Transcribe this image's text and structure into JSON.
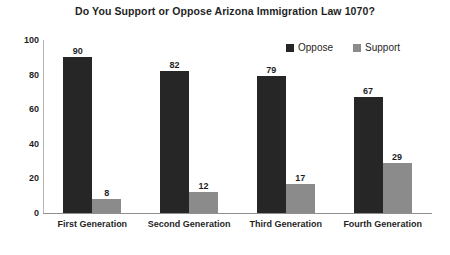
{
  "chart_data": {
    "type": "bar",
    "title": "Do You Support or Oppose Arizona Immigration Law 1070?",
    "xlabel": "",
    "ylabel": "",
    "ylim": [
      0,
      100
    ],
    "yticks": [
      100,
      80,
      60,
      40,
      20,
      0
    ],
    "grid": false,
    "legend_position": "top-right",
    "categories": [
      "First Generation",
      "Second Generation",
      "Third Generation",
      "Fourth Generation"
    ],
    "series": [
      {
        "name": "Oppose",
        "color": "#262626",
        "values": [
          90,
          82,
          79,
          67
        ]
      },
      {
        "name": "Support",
        "color": "#8b8b8b",
        "values": [
          8,
          12,
          17,
          29
        ]
      }
    ]
  },
  "legend": {
    "items": [
      {
        "label": "Oppose",
        "swatch": "oppose"
      },
      {
        "label": "Support",
        "swatch": "support"
      }
    ]
  },
  "colors": {
    "oppose": "#262626",
    "support": "#8b8b8b",
    "axis": "#8f8f8f",
    "text": "#1f1f1f",
    "background": "#ffffff"
  }
}
